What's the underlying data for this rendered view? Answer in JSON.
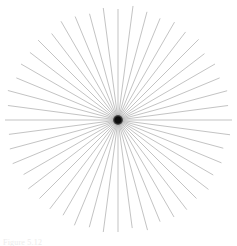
{
  "figure": {
    "background_color": "#ffffff",
    "width": 237,
    "height": 246,
    "caption_text": "Figure 5.12",
    "caption_color": "#e9e9e9"
  },
  "chart_data": {
    "type": "scatter",
    "render_style": "radial-starburst",
    "subtitle": "",
    "xlabel": "",
    "ylabel": "",
    "grid": false,
    "legend_position": "none",
    "axis_visible": false,
    "tick_labels": [],
    "annotations": [],
    "center": {
      "x": 118,
      "y": 120
    },
    "ray_count": 48,
    "angle_step_degrees": 7.5,
    "start_angle_degrees": 0,
    "ray_color": "#9a9a9a",
    "ray_width": 0.6,
    "core_color": "#0d0d0d",
    "core_radius": 5,
    "radius_mean": 112,
    "radius_jitter": 4,
    "xlim": [
      0,
      237
    ],
    "ylim": [
      0,
      246
    ],
    "series": [
      {
        "name": "rays",
        "angles_degrees": [
          0,
          7.5,
          15,
          22.5,
          30,
          37.5,
          45,
          52.5,
          60,
          67.5,
          75,
          82.5,
          90,
          97.5,
          105,
          112.5,
          120,
          127.5,
          135,
          142.5,
          150,
          157.5,
          165,
          172.5,
          180,
          187.5,
          195,
          202.5,
          210,
          217.5,
          225,
          232.5,
          240,
          247.5,
          255,
          262.5,
          270,
          277.5,
          285,
          292.5,
          300,
          307.5,
          315,
          322.5,
          330,
          337.5,
          345,
          352.5
        ],
        "radii": [
          114,
          111,
          113,
          110,
          112,
          109,
          114,
          111,
          113,
          110,
          112,
          115,
          111,
          113,
          110,
          112,
          114,
          109,
          113,
          111,
          112,
          110,
          114,
          111,
          113,
          110,
          112,
          114,
          109,
          113,
          111,
          112,
          110,
          114,
          111,
          113,
          112,
          109,
          114,
          110,
          112,
          113,
          111,
          114,
          110,
          112,
          109,
          113
        ]
      }
    ]
  }
}
